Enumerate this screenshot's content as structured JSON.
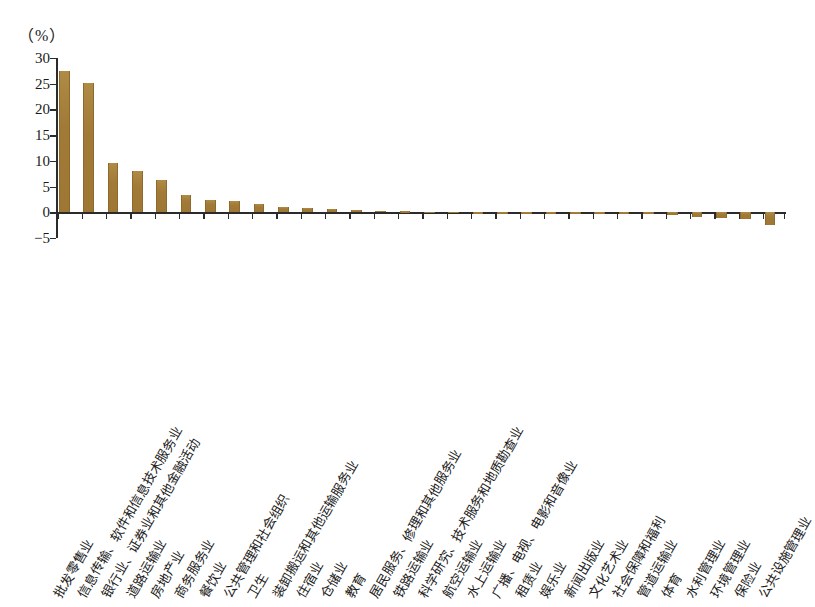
{
  "axis": {
    "unit_label": "（%）",
    "y_ticks": [
      30,
      25,
      20,
      15,
      10,
      5,
      0,
      -5
    ],
    "y_min": -5,
    "y_max": 30
  },
  "chart_data": {
    "type": "bar",
    "title": "",
    "subtitle": "",
    "xlabel": "",
    "ylabel": "（%）",
    "ylim": [
      -5,
      30
    ],
    "grid": false,
    "legend": null,
    "bar_color": "#a9833d",
    "categories": [
      "批发零售业",
      "信息传输、软件和信息技术服务业",
      "银行业、证券业和其他金融活动",
      "道路运输业",
      "房地产业",
      "商务服务业",
      "餐饮业",
      "公共管理和社会组织",
      "卫生",
      "装卸搬运和其他运输服务业",
      "住宿业",
      "仓储业",
      "教育",
      "居民服务、修理和其他服务业",
      "铁路运输业",
      "科学研究、技术服务和地质勘查业",
      "航空运输业",
      "水上运输业",
      "广播、电视、电影和音像业",
      "租赁业",
      "娱乐业",
      "新闻出版业",
      "文化艺术业",
      "社会保障和福利",
      "管道运输业",
      "体育",
      "水利管理业",
      "环境管理业",
      "保险业",
      "公共设施管理业"
    ],
    "values": [
      27.5,
      25.1,
      9.5,
      8.0,
      6.2,
      3.4,
      2.3,
      2.1,
      1.7,
      1.1,
      0.8,
      0.6,
      0.4,
      0.3,
      0.2,
      0.1,
      0.1,
      0.05,
      -0.1,
      -0.1,
      -0.15,
      -0.2,
      -0.2,
      -0.3,
      -0.4,
      -0.5,
      -0.9,
      -1.1,
      -1.4,
      -2.4
    ]
  }
}
